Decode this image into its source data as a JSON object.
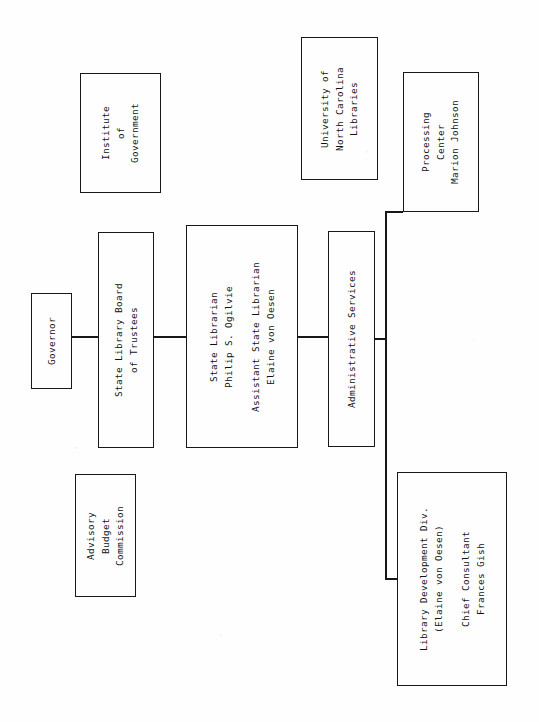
{
  "chart": {
    "type": "org-chart",
    "orientation": "landscape-rotated-90ccw",
    "title_present": false,
    "nodes": [
      {
        "id": "institute-of-government",
        "lines": [
          "Institute",
          "of",
          "Government"
        ],
        "box": {
          "x": 80,
          "y": 73,
          "w": 81,
          "h": 120
        },
        "connected": false
      },
      {
        "id": "governor",
        "lines": [
          "Governor"
        ],
        "box": {
          "x": 31,
          "y": 293,
          "w": 41,
          "h": 96
        },
        "connected": true
      },
      {
        "id": "state-library-board-of-trustees",
        "lines": [
          "State Library Board",
          "of Trustees"
        ],
        "box": {
          "x": 98,
          "y": 232,
          "w": 56,
          "h": 216
        },
        "connected": true
      },
      {
        "id": "advisory-budget-commission",
        "lines": [
          "Advisory",
          "Budget",
          "Commission"
        ],
        "box": {
          "x": 75,
          "y": 474,
          "w": 61,
          "h": 123
        },
        "connected": false
      },
      {
        "id": "state-librarian",
        "lines": [
          "State Librarian",
          "Philip S. Ogilvie",
          "",
          "Assistant State Librarian",
          "Elaine von Oesen"
        ],
        "box": {
          "x": 186,
          "y": 225,
          "w": 112,
          "h": 223
        },
        "connected": true
      },
      {
        "id": "university-of-north-carolina-libraries",
        "lines": [
          "University of",
          "North Carolina",
          "Libraries"
        ],
        "box": {
          "x": 301,
          "y": 37,
          "w": 77,
          "h": 143
        },
        "connected": false
      },
      {
        "id": "administrative-services",
        "lines": [
          "Administrative Services"
        ],
        "box": {
          "x": 328,
          "y": 231,
          "w": 47,
          "h": 216
        },
        "connected": true
      },
      {
        "id": "processing-center",
        "lines": [
          "Processing",
          "Center",
          "Marion Johnson"
        ],
        "box": {
          "x": 403,
          "y": 72,
          "w": 76,
          "h": 140
        },
        "connected": true
      },
      {
        "id": "library-development-division",
        "lines": [
          "Library Development Div.",
          "(Elaine von Oesen)",
          "",
          "Chief Consultant",
          "Frances Gish"
        ],
        "box": {
          "x": 397,
          "y": 472,
          "w": 110,
          "h": 214
        },
        "connected": true
      }
    ],
    "connectors": [
      {
        "id": "governor-to-board",
        "orientation": "h",
        "x": 72,
        "y": 336,
        "len": 26
      },
      {
        "id": "board-to-state-librarian",
        "orientation": "h",
        "x": 154,
        "y": 336,
        "len": 32
      },
      {
        "id": "librarian-to-admin",
        "orientation": "h",
        "x": 298,
        "y": 336,
        "len": 30
      },
      {
        "id": "admin-to-bus",
        "orientation": "h",
        "x": 375,
        "y": 338,
        "len": 11
      },
      {
        "id": "bus-to-processing-center",
        "orientation": "h",
        "x": 385,
        "y": 211,
        "len": 18
      },
      {
        "id": "bus-to-library-dev",
        "orientation": "h",
        "x": 385,
        "y": 578,
        "len": 13
      },
      {
        "id": "vertical-bus",
        "orientation": "v",
        "x": 385,
        "y": 211,
        "len": 369
      }
    ]
  },
  "labels": {
    "institute_of_government": "Institute of Government",
    "governor": "Governor",
    "state_library_board": "State Library Board of Trustees",
    "advisory_budget_commission": "Advisory Budget Commission",
    "state_librarian": "State Librarian Philip S. Ogilvie",
    "assistant_state_librarian": "Assistant State Librarian Elaine von Oesen",
    "unc_libraries": "University of North Carolina Libraries",
    "administrative_services": "Administrative Services",
    "processing_center": "Processing Center Marion Johnson",
    "library_development": "Library Development Div. (Elaine von Oesen) Chief Consultant Frances Gish"
  },
  "colors": {
    "ink": "#16181a",
    "paper": "#fefefe"
  }
}
